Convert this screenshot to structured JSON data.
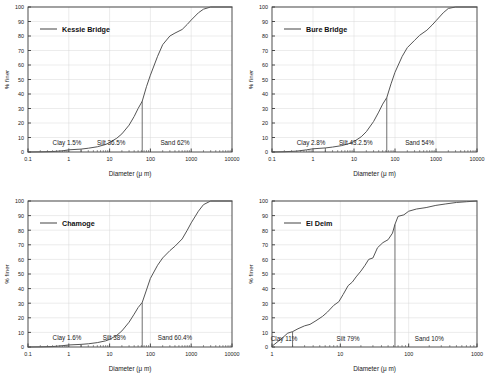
{
  "figure": {
    "axis_y_label": "% finer",
    "axis_x_label": "Diameter (μ m)",
    "y_ticks": [
      "0",
      "10",
      "20",
      "30",
      "40",
      "50",
      "60",
      "70",
      "80",
      "90",
      "100"
    ],
    "x_ticks_decade": [
      "0.1",
      "1",
      "10",
      "100",
      "1000",
      "10000"
    ],
    "x_ticks_eldeim": [
      "1",
      "10",
      "100",
      "1000"
    ],
    "line_color": "#555555",
    "axis_color": "#3a3a3a",
    "grid_color": "#d8d8d8"
  },
  "chart_data": [
    {
      "type": "line",
      "panel": "top-left",
      "title": "",
      "legend": [
        "Kessie Bridge"
      ],
      "xlabel": "Diameter (μ m)",
      "ylabel": "% finer",
      "xscale": "log",
      "xlim": [
        0.1,
        10000
      ],
      "ylim": [
        0,
        100
      ],
      "grid": true,
      "legend_position": "upper-left",
      "annotations": [
        {
          "text": "Clay 1.5%",
          "x_center": 0.9,
          "y": 5
        },
        {
          "text": "Silt 36.5%",
          "x_center": 11,
          "y": 5
        },
        {
          "text": "Sand 62%",
          "x_center": 400,
          "y": 5
        }
      ],
      "dividers_x": [
        2,
        63
      ],
      "x": [
        0.1,
        0.2,
        0.4,
        0.7,
        1,
        2,
        3,
        5,
        8,
        10,
        15,
        20,
        30,
        40,
        50,
        63,
        80,
        100,
        150,
        200,
        300,
        400,
        600,
        800,
        1000,
        1500,
        2000,
        3000,
        10000
      ],
      "y": [
        0.0,
        0.1,
        0.3,
        0.8,
        1.5,
        2.0,
        2.6,
        3.6,
        5.2,
        6.5,
        9.5,
        12.5,
        18.5,
        24.5,
        30.0,
        35.0,
        45.0,
        53.0,
        66.0,
        74.0,
        80.0,
        82.0,
        84.5,
        88.0,
        91.0,
        96.0,
        98.5,
        100.0,
        100.0
      ]
    },
    {
      "type": "line",
      "panel": "top-right",
      "title": "",
      "legend": [
        "Bure Bridge"
      ],
      "xlabel": "Diameter (μ m)",
      "ylabel": "% finer",
      "xscale": "log",
      "xlim": [
        0.1,
        10000
      ],
      "ylim": [
        0,
        100
      ],
      "grid": true,
      "legend_position": "upper-left",
      "annotations": [
        {
          "text": "Clay 2.8%",
          "x_center": 0.9,
          "y": 5
        },
        {
          "text": "Silt 43.2.5%",
          "x_center": 11,
          "y": 5
        },
        {
          "text": "Sand 54%",
          "x_center": 400,
          "y": 5
        }
      ],
      "dividers_x": [
        2,
        63
      ],
      "x": [
        0.1,
        0.2,
        0.4,
        0.7,
        1,
        2,
        3,
        5,
        8,
        10,
        15,
        20,
        30,
        40,
        50,
        63,
        80,
        100,
        150,
        200,
        300,
        400,
        600,
        800,
        1000,
        1500,
        2000,
        3000,
        10000
      ],
      "y": [
        0.0,
        0.2,
        0.6,
        1.5,
        2.2,
        2.8,
        3.4,
        4.4,
        6.0,
        7.2,
        10.5,
        14.0,
        21.0,
        27.5,
        33.0,
        37.5,
        47.0,
        55.0,
        66.0,
        72.0,
        77.0,
        80.5,
        84.0,
        87.5,
        90.5,
        96.0,
        99.0,
        100.0,
        100.0
      ]
    },
    {
      "type": "line",
      "panel": "bottom-left",
      "title": "",
      "legend": [
        "Chamoge"
      ],
      "xlabel": "Diameter (μ m)",
      "ylabel": "% finer",
      "xscale": "log",
      "xlim": [
        0.1,
        10000
      ],
      "ylim": [
        0,
        100
      ],
      "grid": true,
      "legend_position": "upper-left",
      "annotations": [
        {
          "text": "Clay 1.6%",
          "x_center": 0.9,
          "y": 5
        },
        {
          "text": "Silt 38%",
          "x_center": 13,
          "y": 5
        },
        {
          "text": "Sand 60.4%",
          "x_center": 400,
          "y": 5
        }
      ],
      "dividers_x": [
        2,
        63
      ],
      "x": [
        0.1,
        0.2,
        0.4,
        0.7,
        1,
        2,
        3,
        5,
        8,
        10,
        15,
        20,
        30,
        40,
        50,
        63,
        80,
        100,
        150,
        200,
        300,
        400,
        600,
        800,
        1000,
        1500,
        2000,
        3000,
        10000
      ],
      "y": [
        0.0,
        0.1,
        0.3,
        0.9,
        1.4,
        1.8,
        2.2,
        3.0,
        4.2,
        5.2,
        8.0,
        11.0,
        17.0,
        22.5,
        27.0,
        30.5,
        39.0,
        47.0,
        56.0,
        61.0,
        66.0,
        69.0,
        74.0,
        80.0,
        85.0,
        93.0,
        97.5,
        100.0,
        100.0
      ]
    },
    {
      "type": "line",
      "panel": "bottom-right",
      "title": "",
      "legend": [
        "El Deim"
      ],
      "xlabel": "Diameter (μ m)",
      "ylabel": "% finer",
      "xscale": "log",
      "xlim": [
        1,
        1000
      ],
      "ylim": [
        0,
        100
      ],
      "grid": true,
      "legend_position": "upper-left",
      "annotations": [
        {
          "text": "Clay 11%",
          "x_center": 1.5,
          "y": 4
        },
        {
          "text": "Silt 79%",
          "x_center": 13,
          "y": 4
        },
        {
          "text": "Sand 10%",
          "x_center": 200,
          "y": 4
        }
      ],
      "dividers_x": [
        2,
        63
      ],
      "x": [
        1.0,
        1.4,
        1.7,
        2.0,
        2.4,
        3.0,
        3.6,
        4.4,
        5.5,
        6.5,
        8.0,
        9.5,
        11,
        13,
        15,
        17,
        20,
        23,
        26,
        30,
        35,
        42,
        50,
        58,
        63,
        70,
        85,
        100,
        130,
        180,
        250,
        350,
        500,
        700,
        1000
      ],
      "y": [
        0.5,
        6.0,
        9.5,
        10.5,
        12.5,
        14.5,
        15.5,
        18.0,
        21.0,
        24.0,
        28.5,
        31.0,
        36.0,
        42.0,
        44.5,
        48.0,
        52.0,
        56.0,
        60.0,
        61.0,
        68.0,
        71.5,
        73.5,
        78.0,
        84.0,
        89.5,
        90.5,
        93.0,
        94.5,
        95.5,
        97.0,
        98.0,
        99.0,
        99.5,
        100.0
      ]
    }
  ]
}
